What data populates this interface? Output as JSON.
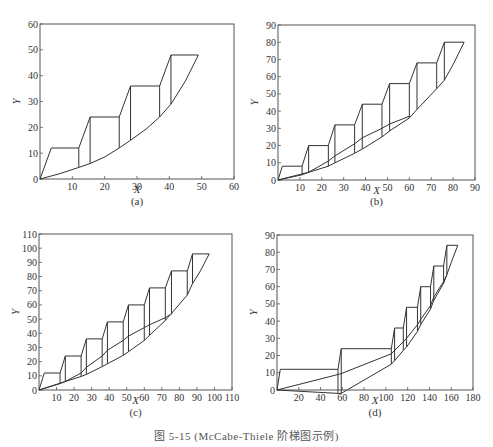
{
  "figure": {
    "caption": "图 5-15  (McCabe-Thiele 阶梯图示例)"
  },
  "style": {
    "line_color": "#333333",
    "axis_color": "#555555"
  },
  "chart_data": [
    {
      "id": "a",
      "type": "line",
      "panel_label": "(a)",
      "xlabel": "X",
      "ylabel": "Y",
      "xlim": [
        0,
        60
      ],
      "ylim": [
        0,
        60
      ],
      "xticks": [
        10,
        20,
        30,
        40,
        50,
        60
      ],
      "yticks": [
        0,
        10,
        20,
        30,
        40,
        50,
        60
      ],
      "box": {
        "left": 40,
        "top": 24,
        "right": 234,
        "bottom": 179
      },
      "label_pos": {
        "panel_y": 205,
        "xlabel_y": 193
      },
      "series": [
        {
          "name": "staircase",
          "points": [
            [
              0,
              0
            ],
            [
              3.5,
              12
            ],
            [
              12,
              12
            ],
            [
              15.5,
              24
            ],
            [
              24.5,
              24
            ],
            [
              28,
              36
            ],
            [
              37,
              36
            ],
            [
              40.5,
              48
            ],
            [
              49,
              48
            ]
          ]
        },
        {
          "name": "lower-curve",
          "points": [
            [
              0,
              0
            ],
            [
              6,
              2
            ],
            [
              12,
              4.5
            ],
            [
              15.5,
              6
            ],
            [
              20,
              8.5
            ],
            [
              24.5,
              12
            ],
            [
              28,
              15
            ],
            [
              33,
              19.5
            ],
            [
              37,
              24
            ],
            [
              40.5,
              29
            ],
            [
              45,
              38
            ],
            [
              49,
              48
            ]
          ]
        }
      ],
      "verticals": [
        [
          12,
          12,
          4.5
        ],
        [
          15.5,
          24,
          6
        ],
        [
          24.5,
          24,
          12
        ],
        [
          28,
          36,
          15
        ],
        [
          37,
          36,
          24
        ],
        [
          40.5,
          48,
          29
        ]
      ]
    },
    {
      "id": "b",
      "type": "line",
      "panel_label": "(b)",
      "xlabel": "X",
      "ylabel": "Y",
      "xlim": [
        0,
        90
      ],
      "ylim": [
        0,
        90
      ],
      "xticks": [
        10,
        20,
        30,
        40,
        50,
        60,
        70,
        80,
        90
      ],
      "yticks": [
        0,
        10,
        20,
        30,
        40,
        50,
        60,
        70,
        80,
        90
      ],
      "box": {
        "left": 278,
        "top": 25,
        "right": 475,
        "bottom": 180
      },
      "label_pos": {
        "panel_y": 205,
        "xlabel_y": 194
      },
      "series": [
        {
          "name": "staircase",
          "points": [
            [
              0,
              0
            ],
            [
              2,
              8
            ],
            [
              11,
              8
            ],
            [
              14,
              20
            ],
            [
              23,
              20
            ],
            [
              26,
              32
            ],
            [
              35,
              32
            ],
            [
              38.5,
              44
            ],
            [
              47.5,
              44
            ],
            [
              51,
              56
            ],
            [
              60,
              56
            ],
            [
              63.5,
              68
            ],
            [
              72.5,
              68
            ],
            [
              76,
              80
            ],
            [
              85,
              80
            ]
          ]
        },
        {
          "name": "lower-curve",
          "points": [
            [
              0,
              0
            ],
            [
              11,
              3
            ],
            [
              14,
              4.5
            ],
            [
              23,
              8
            ],
            [
              26,
              10
            ],
            [
              35,
              15.5
            ],
            [
              38.5,
              18
            ],
            [
              47.5,
              25
            ],
            [
              51,
              28.5
            ],
            [
              60,
              36
            ],
            [
              63.5,
              41
            ],
            [
              72.5,
              53
            ],
            [
              76,
              58
            ],
            [
              80,
              67
            ],
            [
              85,
              80
            ]
          ]
        },
        {
          "name": "middle-curve",
          "points": [
            [
              0,
              0
            ],
            [
              14,
              4.5
            ],
            [
              23,
              11
            ],
            [
              26,
              14
            ],
            [
              35,
              21
            ],
            [
              38.5,
              24.5
            ],
            [
              47.5,
              30
            ],
            [
              51,
              32.5
            ],
            [
              60,
              37
            ]
          ]
        }
      ],
      "verticals": [
        [
          11,
          8,
          3
        ],
        [
          14,
          20,
          4.5
        ],
        [
          23,
          20,
          8
        ],
        [
          26,
          32,
          10
        ],
        [
          35,
          32,
          15.5
        ],
        [
          38.5,
          44,
          18
        ],
        [
          47.5,
          44,
          25
        ],
        [
          51,
          56,
          28.5
        ],
        [
          60,
          56,
          36
        ],
        [
          63.5,
          68,
          41
        ],
        [
          72.5,
          68,
          53
        ],
        [
          76,
          80,
          58
        ]
      ]
    },
    {
      "id": "c",
      "type": "line",
      "panel_label": "(c)",
      "xlabel": "X",
      "ylabel": "Y",
      "xlim": [
        0,
        110
      ],
      "ylim": [
        0,
        110
      ],
      "xticks": [
        10,
        20,
        30,
        40,
        50,
        60,
        70,
        80,
        90,
        100,
        110
      ],
      "yticks": [
        0,
        10,
        20,
        30,
        40,
        50,
        60,
        70,
        80,
        90,
        100,
        110
      ],
      "box": {
        "left": 39,
        "top": 234,
        "right": 232,
        "bottom": 390
      },
      "label_pos": {
        "panel_y": 416,
        "xlabel_y": 404
      },
      "series": [
        {
          "name": "staircase",
          "points": [
            [
              0,
              0
            ],
            [
              3,
              12
            ],
            [
              12,
              12
            ],
            [
              15,
              24
            ],
            [
              24,
              24
            ],
            [
              27,
              36
            ],
            [
              36,
              36
            ],
            [
              39,
              48
            ],
            [
              48,
              48
            ],
            [
              51,
              60
            ],
            [
              60,
              60
            ],
            [
              63,
              72
            ],
            [
              72,
              72
            ],
            [
              75.5,
              84
            ],
            [
              84.5,
              84
            ],
            [
              87.5,
              96
            ],
            [
              97,
              96
            ]
          ]
        },
        {
          "name": "lower-curve",
          "points": [
            [
              0,
              0
            ],
            [
              12,
              4.5
            ],
            [
              15,
              6
            ],
            [
              24,
              9.5
            ],
            [
              27,
              11
            ],
            [
              36,
              16.5
            ],
            [
              39,
              18.5
            ],
            [
              48,
              24.5
            ],
            [
              51,
              27
            ],
            [
              60,
              35
            ],
            [
              63,
              38.5
            ],
            [
              72,
              49
            ],
            [
              75.5,
              54
            ],
            [
              84.5,
              67
            ],
            [
              87.5,
              75
            ],
            [
              92,
              84
            ],
            [
              97,
              96
            ]
          ]
        },
        {
          "name": "middle-curve",
          "points": [
            [
              0,
              0
            ],
            [
              15,
              6
            ],
            [
              24,
              12
            ],
            [
              27,
              16
            ],
            [
              36,
              24
            ],
            [
              39,
              28
            ],
            [
              48,
              35
            ],
            [
              51,
              38
            ],
            [
              60,
              44
            ],
            [
              63,
              46
            ],
            [
              72,
              51
            ],
            [
              76,
              54
            ]
          ]
        }
      ],
      "verticals": [
        [
          12,
          12,
          4.5
        ],
        [
          15,
          24,
          6
        ],
        [
          24,
          24,
          9.5
        ],
        [
          27,
          36,
          11
        ],
        [
          36,
          36,
          16.5
        ],
        [
          39,
          48,
          18.5
        ],
        [
          48,
          48,
          24.5
        ],
        [
          51,
          60,
          27
        ],
        [
          60,
          60,
          35
        ],
        [
          63,
          72,
          38.5
        ],
        [
          72,
          72,
          49
        ],
        [
          75.5,
          84,
          54
        ],
        [
          84.5,
          84,
          67
        ],
        [
          87.5,
          96,
          75
        ]
      ]
    },
    {
      "id": "d",
      "type": "line",
      "panel_label": "(d)",
      "xlabel": "X",
      "ylabel": "Y",
      "xlim": [
        0,
        180
      ],
      "ylim": [
        0,
        90
      ],
      "xticks": [
        20,
        40,
        60,
        80,
        100,
        120,
        140,
        160,
        180
      ],
      "yticks": [
        0,
        10,
        20,
        30,
        40,
        50,
        60,
        70,
        80,
        90
      ],
      "box": {
        "left": 277,
        "top": 235,
        "right": 473,
        "bottom": 390
      },
      "label_pos": {
        "panel_y": 416,
        "xlabel_y": 404
      },
      "series": [
        {
          "name": "staircase",
          "points": [
            [
              0,
              0
            ],
            [
              3,
              12
            ],
            [
              56,
              12
            ],
            [
              59,
              24
            ],
            [
              105,
              24
            ],
            [
              108,
              36
            ],
            [
              116,
              36
            ],
            [
              119,
              48
            ],
            [
              129,
              48
            ],
            [
              132,
              60
            ],
            [
              141,
              60
            ],
            [
              144,
              72
            ],
            [
              153,
              72
            ],
            [
              156,
              84
            ],
            [
              166,
              84
            ]
          ]
        },
        {
          "name": "lower-curve",
          "points": [
            [
              0,
              0
            ],
            [
              56,
              -2
            ],
            [
              59,
              -2
            ],
            [
              105,
              15
            ],
            [
              108,
              17
            ],
            [
              116,
              23
            ],
            [
              119,
              25
            ],
            [
              129,
              34
            ],
            [
              132,
              38
            ],
            [
              141,
              47
            ],
            [
              144,
              52
            ],
            [
              153,
              62
            ],
            [
              156,
              67
            ],
            [
              160,
              74
            ],
            [
              166,
              84
            ]
          ]
        },
        {
          "name": "middle-curve",
          "points": [
            [
              0,
              0
            ],
            [
              56,
              9
            ],
            [
              59,
              9.5
            ],
            [
              105,
              21
            ],
            [
              108,
              23
            ],
            [
              116,
              28
            ],
            [
              119,
              30
            ],
            [
              129,
              38
            ],
            [
              132,
              41
            ],
            [
              141,
              49
            ],
            [
              144,
              54
            ],
            [
              153,
              63
            ],
            [
              156,
              67
            ]
          ]
        }
      ],
      "verticals": [
        [
          56,
          12,
          -2
        ],
        [
          59,
          24,
          -2
        ],
        [
          105,
          24,
          15
        ],
        [
          108,
          36,
          17
        ],
        [
          116,
          36,
          23
        ],
        [
          119,
          48,
          25
        ],
        [
          129,
          48,
          34
        ],
        [
          132,
          60,
          38
        ],
        [
          141,
          60,
          47
        ],
        [
          144,
          72,
          52
        ],
        [
          153,
          72,
          62
        ],
        [
          156,
          84,
          67
        ]
      ]
    }
  ]
}
